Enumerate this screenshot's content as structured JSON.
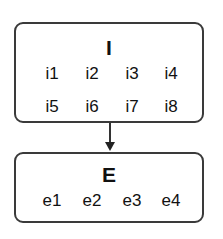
{
  "diagram": {
    "nodes": [
      {
        "id": "I",
        "title": "I",
        "items": [
          "i1",
          "i2",
          "i3",
          "i4",
          "i5",
          "i6",
          "i7",
          "i8"
        ]
      },
      {
        "id": "E",
        "title": "E",
        "items": [
          "e1",
          "e2",
          "e3",
          "e4"
        ]
      }
    ],
    "edges": [
      {
        "from": "I",
        "to": "E",
        "type": "arrow"
      }
    ],
    "colors": {
      "border": "#3a3a3a",
      "text": "#111111",
      "background": "#ffffff"
    }
  }
}
